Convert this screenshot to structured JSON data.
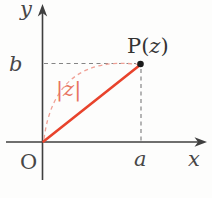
{
  "figure": {
    "labels": {
      "y_axis": "y",
      "x_axis": "x",
      "origin": "O",
      "b_tick": "b",
      "a_tick": "a",
      "modulus": "|z|",
      "point": {
        "prefix": "P(",
        "var": "z",
        "suffix": ")"
      }
    },
    "colors": {
      "accent_red": "#e8432c",
      "arc_pink": "#f0a196",
      "modulus_text": "#e87360",
      "axis": "#3f3f3f",
      "label_gray": "#474747",
      "point_label": "#333333",
      "dash_gray": "#858585",
      "dot": "#1a1a1a"
    }
  }
}
